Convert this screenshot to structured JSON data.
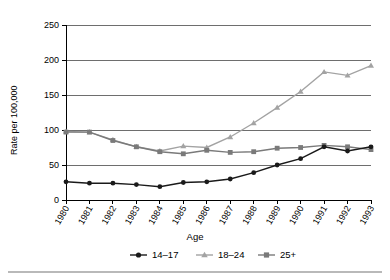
{
  "chart_data": {
    "type": "line",
    "title": "",
    "xlabel": "",
    "ylabel": "Rate per 100,000",
    "legend_title": "Age",
    "legend_position": "bottom",
    "grid": true,
    "x": [
      "1980",
      "1981",
      "1982",
      "1983",
      "1984",
      "1985",
      "1986",
      "1987",
      "1988",
      "1989",
      "1990",
      "1991",
      "1992",
      "1993"
    ],
    "xlim": [
      "1980",
      "1993"
    ],
    "ylim": [
      0,
      250
    ],
    "yticks": [
      0,
      50,
      100,
      150,
      200,
      250
    ],
    "ytick_labels": [
      "0",
      "50",
      "100",
      "150",
      "200",
      "250"
    ],
    "series": [
      {
        "name": "14–17",
        "color": "#1a1a1a",
        "marker": "circle",
        "values": [
          26,
          24,
          24,
          22,
          19,
          25,
          26,
          30,
          39,
          50,
          59,
          76,
          70,
          76
        ]
      },
      {
        "name": "18–24",
        "color": "#a3a3a3",
        "marker": "triangle",
        "values": [
          98,
          97,
          86,
          76,
          70,
          77,
          75,
          90,
          110,
          132,
          155,
          183,
          178,
          192
        ]
      },
      {
        "name": "25+",
        "color": "#7a7a7a",
        "marker": "square",
        "values": [
          97,
          97,
          85,
          76,
          69,
          66,
          71,
          68,
          69,
          74,
          75,
          78,
          76,
          72
        ]
      }
    ]
  },
  "axes": {
    "y_axis_label": "Rate per 100,000"
  },
  "legend": {
    "title": "Age",
    "entries": [
      {
        "label": "14–17"
      },
      {
        "label": "18–24"
      },
      {
        "label": "25+"
      }
    ]
  }
}
